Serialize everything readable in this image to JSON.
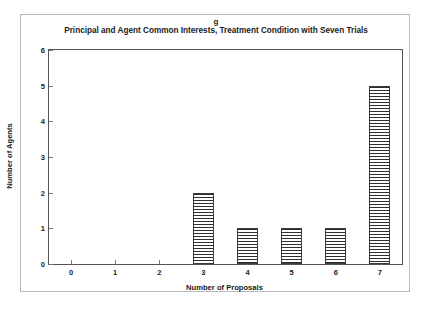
{
  "figure": {
    "panel_label": "g",
    "title": "Principal and Agent Common Interests, Treatment Condition with Seven Trials"
  },
  "chart_data": {
    "type": "bar",
    "title": "Principal and Agent Common Interests, Treatment Condition with Seven Trials",
    "xlabel": "Number of Proposals",
    "ylabel": "Number of Agents",
    "categories": [
      "0",
      "1",
      "2",
      "3",
      "4",
      "5",
      "6",
      "7"
    ],
    "values": [
      0,
      0,
      0,
      2,
      1,
      1,
      1,
      5
    ],
    "ylim": [
      0,
      6
    ],
    "yticks": [
      "0",
      "1",
      "2",
      "3",
      "4",
      "5",
      "6"
    ],
    "grid": false,
    "legend": null,
    "bar_fill": "horizontal-hatch",
    "bar_edge_color": "#3a3a3a",
    "axis_color": "#555555",
    "background": "#ffffff"
  }
}
